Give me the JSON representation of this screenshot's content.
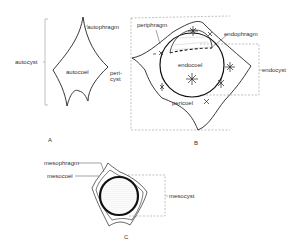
{
  "figure": {
    "panels": [
      {
        "id": "A",
        "label": "A",
        "labels": {
          "autocyst": "autocyst",
          "autophragm": "autophragm",
          "autocoel": "autocoel",
          "pericyst": "peri-\ncyst"
        }
      },
      {
        "id": "B",
        "label": "B",
        "labels": {
          "periphragm": "periphragm",
          "endophragm": "endophragm",
          "endocoel": "endocoel",
          "endocyst": "endocyst",
          "pericoel": "pericoel"
        }
      },
      {
        "id": "C",
        "label": "C",
        "labels": {
          "mesophragm": "mesophragm",
          "mesocoel": "mesocoel",
          "mesocyst": "mesocyst"
        }
      }
    ]
  }
}
